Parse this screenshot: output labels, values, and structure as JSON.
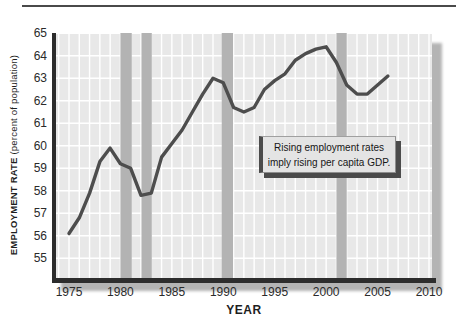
{
  "figure": {
    "top_rule_color": "#4a4a4a",
    "background": "#ffffff"
  },
  "chart_data": {
    "type": "line",
    "title": "",
    "xlabel": "YEAR",
    "ylabel_bold": "EMPLOYMENT RATE",
    "ylabel_normal": "(percent of population)",
    "series_name": "employment-rate",
    "years": [
      1975,
      1976,
      1977,
      1978,
      1979,
      1980,
      1981,
      1982,
      1983,
      1984,
      1985,
      1986,
      1987,
      1988,
      1989,
      1990,
      1991,
      1992,
      1993,
      1994,
      1995,
      1996,
      1997,
      1998,
      1999,
      2000,
      2001,
      2002,
      2003,
      2004,
      2005,
      2006
    ],
    "values": [
      56.1,
      56.8,
      57.9,
      59.3,
      59.9,
      59.2,
      59.0,
      57.8,
      57.9,
      59.5,
      60.1,
      60.7,
      61.5,
      62.3,
      63.0,
      62.8,
      61.7,
      61.5,
      61.7,
      62.5,
      62.9,
      63.2,
      63.8,
      64.1,
      64.3,
      64.4,
      63.7,
      62.7,
      62.3,
      62.3,
      62.7,
      63.1
    ],
    "x_ticks": [
      1975,
      1980,
      1985,
      1990,
      1995,
      2000,
      2005,
      2010
    ],
    "y_ticks": [
      55,
      56,
      57,
      58,
      59,
      60,
      61,
      62,
      63,
      64,
      65
    ],
    "xlim": [
      1973.8,
      2010.3
    ],
    "ylim": [
      54.1,
      65
    ],
    "grid": "on",
    "recession_bands": [
      [
        1980.0,
        1981.1
      ],
      [
        1982.05,
        1983.05
      ],
      [
        1989.85,
        1990.95
      ],
      [
        2001.0,
        2002.0
      ]
    ],
    "colors": {
      "plot_background": "#e8e8e8",
      "gridline": "#ffffff",
      "recession_band": "#b3b3b3",
      "line": "#4d4d4d",
      "axis": "#2d2d2d",
      "plot_drop_shadow": "#b4b4b4"
    }
  },
  "annotation": {
    "line1": "Rising employment rates",
    "line2": "imply rising per capita GDP."
  }
}
